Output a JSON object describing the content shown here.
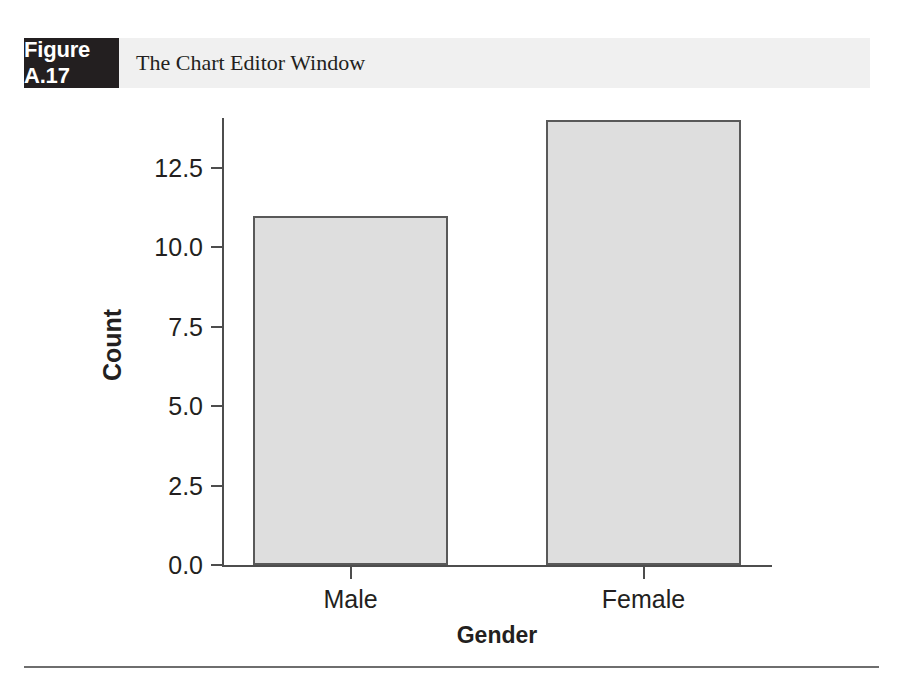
{
  "figure": {
    "number": "Figure A.17",
    "caption": "The Chart Editor Window"
  },
  "chart_data": {
    "type": "bar",
    "title": "",
    "categories": [
      "Male",
      "Female"
    ],
    "values": [
      11,
      14
    ],
    "xlabel": "Gender",
    "ylabel": "Count",
    "ylim": [
      0.0,
      12.5
    ],
    "yticks": [
      "0.0",
      "2.5",
      "5.0",
      "7.5",
      "10.0",
      "12.5"
    ],
    "ytick_values": [
      0.0,
      2.5,
      5.0,
      7.5,
      10.0,
      12.5
    ],
    "grid": false,
    "legend": false,
    "bar_fill_color": "#dedede",
    "bar_border_color": "#595959",
    "axis_color": "#4d4d4d"
  }
}
